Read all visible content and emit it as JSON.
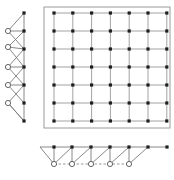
{
  "diagram": {
    "colors": {
      "background": "#ffffff",
      "line": "#8c8c8c",
      "filled_node": "#1e1e1e",
      "open_node_stroke": "#555555",
      "frame": "#9a9a9a"
    },
    "grid": {
      "rows": 7,
      "cols": 7,
      "frame": {
        "x": 44,
        "y": 7,
        "w": 126,
        "h": 121
      },
      "origin": {
        "x": 54,
        "y": 13
      },
      "step_x": 18.8,
      "step_y": 18
    },
    "left_chain": {
      "filled_x": 24,
      "filled_y": [
        13,
        31,
        49,
        67,
        85,
        103,
        121
      ],
      "open_x": 8,
      "open_y": [
        31,
        47,
        67,
        85,
        103
      ],
      "open_links": [
        [
          0,
          1
        ],
        [
          1,
          2
        ],
        [
          2,
          3
        ],
        [
          3,
          4
        ],
        [
          4,
          5
        ]
      ],
      "extra_links": [
        [
          2,
          2
        ],
        [
          2,
          4
        ]
      ]
    },
    "bottom_chain": {
      "filled_y": 147,
      "filled_x": [
        54,
        72,
        91,
        110,
        129,
        148,
        167
      ],
      "open_y": 164,
      "open_x": [
        54,
        72,
        91,
        110,
        129
      ],
      "lead_in_x": 40
    }
  }
}
